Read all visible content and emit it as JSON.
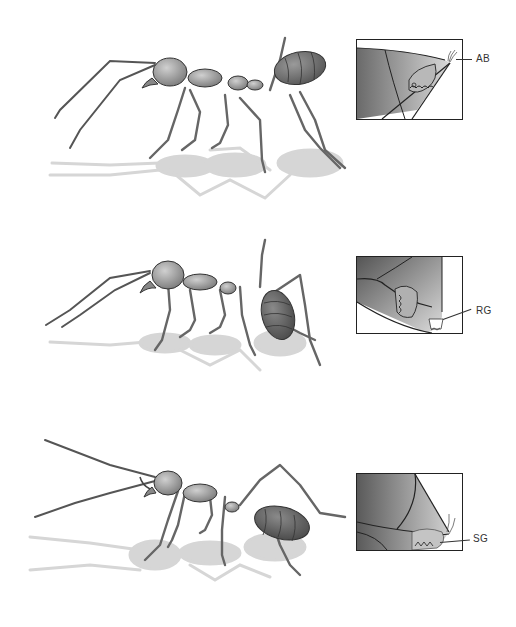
{
  "figure": {
    "panels": [
      {
        "id": "top",
        "description": "Ant walking, abdomen raised; inset shows abdominal tip with gland AB",
        "inset_label": "AB"
      },
      {
        "id": "middle",
        "description": "Ant with abdomen lowered; inset shows abdominal tip with gland RG",
        "inset_label": "RG"
      },
      {
        "id": "bottom",
        "description": "Ant with abdomen dragging; inset shows abdominal tip with gland SG",
        "inset_label": "SG"
      }
    ]
  },
  "colors": {
    "body": "#9a9a9a",
    "body_dark": "#6e6e6e",
    "shadow": "#d4d4d4",
    "outline": "#2a2a2a",
    "inset_border": "#222222"
  }
}
